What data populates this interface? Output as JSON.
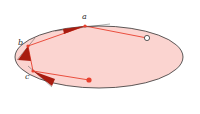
{
  "diagram": {
    "colors": {
      "ellipse_fill": "#fbd4d0",
      "ellipse_stroke": "#333333",
      "path": "#e8402e",
      "triangle": "#a81c10",
      "open_point_fill": "#ffffff",
      "end_point": "#e8402e"
    },
    "ellipse": {
      "cx": 99,
      "cy": 57,
      "rx": 84,
      "ry": 31
    },
    "points": [
      {
        "id": "a",
        "label": "a",
        "x": 85,
        "y": 26,
        "label_x": 82,
        "label_y": 19
      },
      {
        "id": "b",
        "label": "b",
        "x": 28,
        "y": 46,
        "label_x": 18,
        "label_y": 45
      },
      {
        "id": "c",
        "label": "c",
        "x": 33,
        "y": 71,
        "label_x": 25,
        "label_y": 79
      }
    ],
    "start_point": {
      "x": 147,
      "y": 38,
      "style": "open"
    },
    "end_point": {
      "x": 89,
      "y": 80,
      "style": "filled"
    }
  }
}
